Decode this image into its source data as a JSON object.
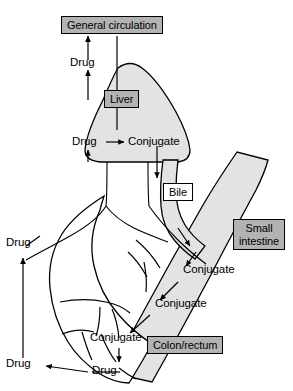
{
  "figure": {
    "colors": {
      "organ_fill": "#e3e3e3",
      "label_fill": "#b3b3b3",
      "label_light_fill": "#ffffff",
      "stroke": "#000000",
      "background": "#ffffff"
    }
  },
  "boxed_labels": {
    "general_circulation": "General circulation",
    "liver": "Liver",
    "bile": "Bile",
    "small_intestine": "Small intestine",
    "colon_rectum": "Colon/rectum"
  },
  "flow_labels": {
    "drug_to_circulation": "Drug",
    "drug_in_liver": "Drug",
    "conjugate_in_liver": "Conjugate",
    "drug_upper_gut": "Drug",
    "drug_lower_gut": "Drug",
    "conjugate_intestine_1": "Conjugate",
    "conjugate_intestine_2": "Conjugate",
    "conjugate_colon": "Conjugate",
    "drug_colon": "Drug"
  },
  "pathways": [
    {
      "from": "Liver",
      "to": "General circulation",
      "species": "Drug"
    },
    {
      "from": "Drug",
      "to": "Conjugate",
      "species": "Conjugate",
      "site": "Liver"
    },
    {
      "from": "Liver",
      "to": "Small intestine",
      "species": "Conjugate",
      "route": "Bile"
    },
    {
      "from": "Small intestine",
      "to": "Colon/rectum",
      "species": "Conjugate"
    },
    {
      "from": "Colon/rectum",
      "to": "Drug",
      "species": "Drug"
    },
    {
      "from": "Gut",
      "to": "Liver",
      "species": "Drug",
      "route": "Portal vein"
    }
  ]
}
